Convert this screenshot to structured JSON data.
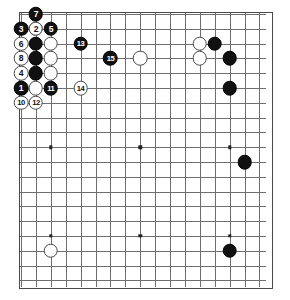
{
  "app": {
    "title": "Go Board Diagram",
    "type": "go-game-record"
  },
  "board": {
    "label": "Go board (goban) section, 17 columns x 19 rows visible",
    "cols": 17,
    "rows": 19,
    "origin_x": 20,
    "origin_y": 13,
    "spacing_x": 14.9,
    "spacing_y": 14.8,
    "line_color": "#6f6f6f",
    "border_color": "#4a4a4a",
    "background_color": "#ffffff",
    "star_points": [
      {
        "col": 2,
        "row": 9
      },
      {
        "col": 8,
        "row": 9
      },
      {
        "col": 14,
        "row": 9
      },
      {
        "col": 2,
        "row": 15
      },
      {
        "col": 8,
        "row": 15
      },
      {
        "col": 14,
        "row": 15
      }
    ]
  },
  "stones": [
    {
      "id": "w-a",
      "color": "white",
      "col": 1,
      "row": 1,
      "label": ""
    },
    {
      "id": "b-7",
      "color": "black",
      "col": 1,
      "row": 0,
      "label": "7"
    },
    {
      "id": "b-3",
      "color": "black",
      "col": 0,
      "row": 1,
      "label": "3"
    },
    {
      "id": "w-2",
      "color": "white",
      "col": 1,
      "row": 1,
      "label": "2"
    },
    {
      "id": "b-5",
      "color": "black",
      "col": 2,
      "row": 1,
      "label": "5"
    },
    {
      "id": "w-6",
      "color": "white",
      "col": 0,
      "row": 2,
      "label": "6"
    },
    {
      "id": "b-c1-r2",
      "color": "black",
      "col": 1,
      "row": 2,
      "label": ""
    },
    {
      "id": "w-c2-r2",
      "color": "white",
      "col": 2,
      "row": 2,
      "label": ""
    },
    {
      "id": "w-8",
      "color": "white",
      "col": 0,
      "row": 3,
      "label": "8"
    },
    {
      "id": "b-c1-r3",
      "color": "black",
      "col": 1,
      "row": 3,
      "label": ""
    },
    {
      "id": "w-c2-r3",
      "color": "white",
      "col": 2,
      "row": 3,
      "label": ""
    },
    {
      "id": "w-4",
      "color": "white",
      "col": 0,
      "row": 4,
      "label": "4"
    },
    {
      "id": "b-c1-r4",
      "color": "black",
      "col": 1,
      "row": 4,
      "label": ""
    },
    {
      "id": "w-c2-r4",
      "color": "white",
      "col": 2,
      "row": 4,
      "label": ""
    },
    {
      "id": "b-1",
      "color": "black",
      "col": 0,
      "row": 5,
      "label": "1"
    },
    {
      "id": "w-c1-r5",
      "color": "white",
      "col": 1,
      "row": 5,
      "label": ""
    },
    {
      "id": "b-11",
      "color": "black",
      "col": 2,
      "row": 5,
      "label": "11"
    },
    {
      "id": "w-10",
      "color": "white",
      "col": 0,
      "row": 6,
      "label": "10"
    },
    {
      "id": "w-12",
      "color": "white",
      "col": 1,
      "row": 6,
      "label": "12"
    },
    {
      "id": "b-13",
      "color": "black",
      "col": 4,
      "row": 2,
      "label": "13"
    },
    {
      "id": "b-15",
      "color": "black",
      "col": 6,
      "row": 3,
      "label": "15"
    },
    {
      "id": "w-14",
      "color": "white",
      "col": 4,
      "row": 5,
      "label": "14"
    },
    {
      "id": "w-center",
      "color": "white",
      "col": 8,
      "row": 3,
      "label": ""
    },
    {
      "id": "w-r-upper",
      "color": "white",
      "col": 12,
      "row": 2,
      "label": ""
    },
    {
      "id": "w-r-lower",
      "color": "white",
      "col": 12,
      "row": 3,
      "label": ""
    },
    {
      "id": "b-r-top",
      "color": "black",
      "col": 13,
      "row": 2,
      "label": ""
    },
    {
      "id": "b-r-mid",
      "color": "black",
      "col": 14,
      "row": 3,
      "label": ""
    },
    {
      "id": "b-r-low",
      "color": "black",
      "col": 14,
      "row": 5,
      "label": ""
    },
    {
      "id": "b-right-9",
      "color": "black",
      "col": 15,
      "row": 10,
      "label": ""
    },
    {
      "id": "w-bottom-left",
      "color": "white",
      "col": 2,
      "row": 16,
      "label": ""
    },
    {
      "id": "b-bottom-right",
      "color": "black",
      "col": 14,
      "row": 16,
      "label": ""
    }
  ],
  "move_sequence": {
    "caption": "Numbered move order",
    "moves": [
      {
        "number": "1",
        "color": "black"
      },
      {
        "number": "2",
        "color": "white"
      },
      {
        "number": "3",
        "color": "black"
      },
      {
        "number": "4",
        "color": "white"
      },
      {
        "number": "5",
        "color": "black"
      },
      {
        "number": "6",
        "color": "white"
      },
      {
        "number": "7",
        "color": "black"
      },
      {
        "number": "8",
        "color": "white"
      },
      {
        "number": "10",
        "color": "white"
      },
      {
        "number": "11",
        "color": "black"
      },
      {
        "number": "12",
        "color": "white"
      },
      {
        "number": "13",
        "color": "black"
      },
      {
        "number": "14",
        "color": "white"
      },
      {
        "number": "15",
        "color": "black"
      }
    ]
  },
  "colors": {
    "black_stone": "#111111",
    "white_stone": "#ffffff",
    "grid": "#6f6f6f",
    "border": "#4a4a4a",
    "black_label": "#ffffff",
    "white_label": "#111111"
  }
}
